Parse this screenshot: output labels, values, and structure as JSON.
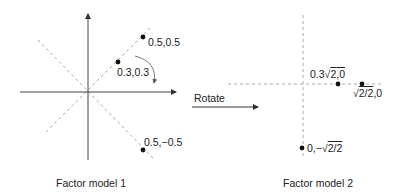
{
  "diagram": {
    "left_panel": {
      "caption": "Factor model 1",
      "points": [
        {
          "label": "0.5,0.5",
          "x": 0.5,
          "y": 0.5
        },
        {
          "label": "0.3,0.3",
          "x": 0.3,
          "y": 0.3
        },
        {
          "label": "0.5,−0.5",
          "x": 0.5,
          "y": -0.5
        }
      ]
    },
    "transition": {
      "label": "Rotate"
    },
    "right_panel": {
      "caption": "Factor model 2",
      "points": [
        {
          "label_prefix": "0.3",
          "label_radical": "2",
          "label_suffix": ",0"
        },
        {
          "label_radical": "2/2",
          "label_suffix": ",0"
        },
        {
          "label_prefix": "0,−",
          "label_radical": "2/2",
          "label_suffix": ""
        }
      ]
    },
    "colors": {
      "axis": "#333333",
      "dashed": "#aaaaaa",
      "point": "#111111"
    }
  }
}
